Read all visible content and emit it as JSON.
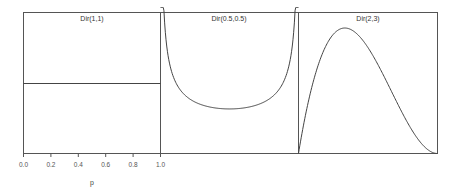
{
  "chart_data": {
    "type": "line",
    "xlabel": "p",
    "ylabel": "",
    "x_ticks": [
      "0.0",
      "0.2",
      "0.4",
      "0.6",
      "0.8",
      "1.0"
    ],
    "xlim": [
      0,
      1
    ],
    "grid": false,
    "legend": null,
    "panels": [
      {
        "title": "Dir(1,1)",
        "alpha": [
          1,
          1
        ],
        "description": "Uniform density, flat line at 1",
        "x": [
          0,
          0.25,
          0.5,
          0.75,
          1
        ],
        "y": [
          1,
          1,
          1,
          1,
          1
        ]
      },
      {
        "title": "Dir(0.5,0.5)",
        "alpha": [
          0.5,
          0.5
        ],
        "description": "U-shaped density, diverging at 0 and 1, minimum ~0.64 at p=0.5",
        "x": [
          0.02,
          0.05,
          0.1,
          0.2,
          0.3,
          0.4,
          0.5,
          0.6,
          0.7,
          0.8,
          0.9,
          0.95,
          0.98
        ],
        "y": [
          2.27,
          1.46,
          1.06,
          0.8,
          0.69,
          0.65,
          0.64,
          0.65,
          0.69,
          0.8,
          1.06,
          1.46,
          2.27
        ]
      },
      {
        "title": "Dir(2,3)",
        "alpha": [
          2,
          3
        ],
        "description": "Unimodal density skewed left, peak ~1.78 at p=1/3",
        "x": [
          0,
          0.1,
          0.2,
          0.3333,
          0.4,
          0.5,
          0.6,
          0.7,
          0.8,
          0.9,
          1
        ],
        "y": [
          0,
          0.97,
          1.54,
          1.78,
          1.73,
          1.5,
          1.15,
          0.76,
          0.38,
          0.11,
          0
        ]
      }
    ]
  },
  "panels": [
    {
      "title": "Dir(1,1)"
    },
    {
      "title": "Dir(0.5,0.5)"
    },
    {
      "title": "Dir(2,3)"
    }
  ],
  "axis": {
    "xlabel": "p",
    "ticks": [
      "0.0",
      "0.2",
      "0.4",
      "0.6",
      "0.8",
      "1.0"
    ]
  }
}
